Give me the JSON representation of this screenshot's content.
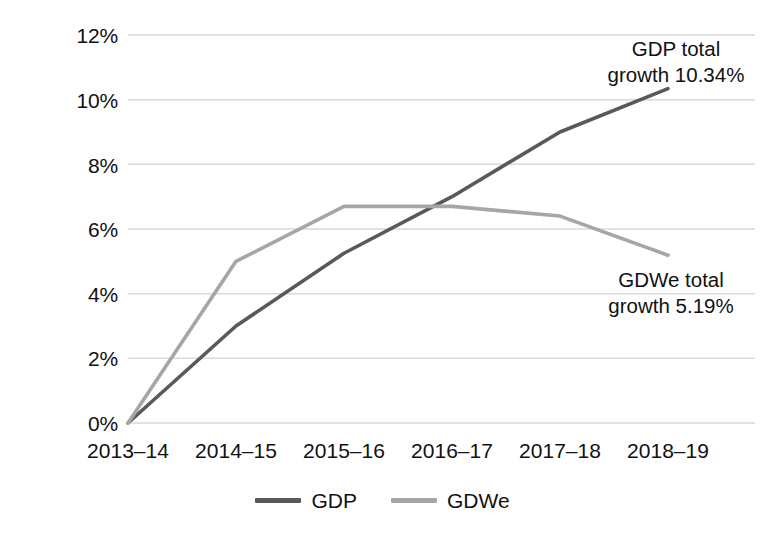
{
  "chart_data": {
    "type": "line",
    "title": "",
    "xlabel": "",
    "ylabel": "",
    "categories": [
      "2013–14",
      "2014–15",
      "2015–16",
      "2016–17",
      "2017–18",
      "2018–19"
    ],
    "series": [
      {
        "name": "GDP",
        "color": "#595959",
        "values": [
          0,
          3.0,
          5.25,
          7.0,
          9.0,
          10.34
        ]
      },
      {
        "name": "GDWe",
        "color": "#a6a6a6",
        "values": [
          0,
          5.0,
          6.7,
          6.7,
          6.4,
          5.19
        ]
      }
    ],
    "ylim": [
      0,
      12
    ],
    "ytick_step": 2,
    "ytick_labels": [
      "0%",
      "2%",
      "4%",
      "6%",
      "8%",
      "10%",
      "12%"
    ],
    "ytick_values": [
      0,
      2,
      4,
      6,
      8,
      10,
      12
    ],
    "grid": true,
    "grid_color": "#d9d9d9",
    "legend_position": "bottom",
    "annotations": [
      {
        "id": "gdp-total-growth",
        "line1": "GDP total",
        "line2": "growth 10.34%"
      },
      {
        "id": "gdwe-total-growth",
        "line1": "GDWe total",
        "line2": "growth 5.19%"
      }
    ]
  },
  "legend": {
    "items": [
      {
        "label": "GDP",
        "color": "#595959"
      },
      {
        "label": "GDWe",
        "color": "#a6a6a6"
      }
    ]
  }
}
